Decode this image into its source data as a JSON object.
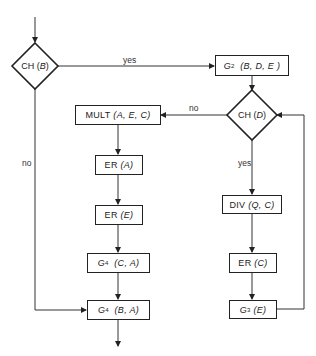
{
  "diagram": {
    "type": "flowchart",
    "decisions": [
      {
        "id": "ch_b",
        "label": "CH (B)"
      },
      {
        "id": "ch_d",
        "label": "CH (D)"
      }
    ],
    "processes": [
      {
        "id": "g2",
        "label": "G2 (B, D, E)"
      },
      {
        "id": "mult",
        "label": "MULT (A, E, C)"
      },
      {
        "id": "er_a",
        "label": "ER (A)"
      },
      {
        "id": "er_e",
        "label": "ER (E)"
      },
      {
        "id": "g4_ca",
        "label": "G4 (C, A)"
      },
      {
        "id": "g4_ba",
        "label": "G4 (B, A)"
      },
      {
        "id": "div",
        "label": "DIV (Q, C)"
      },
      {
        "id": "er_c",
        "label": "ER (C)"
      },
      {
        "id": "g3",
        "label": "G3 (E)"
      }
    ],
    "edge_labels": {
      "ch_b_yes": "yes",
      "ch_b_no": "no",
      "ch_d_no": "no",
      "ch_d_yes": "yes"
    },
    "edges": [
      {
        "from": "start",
        "to": "ch_b"
      },
      {
        "from": "ch_b",
        "to": "g2",
        "label": "yes"
      },
      {
        "from": "ch_b",
        "to": "g4_ba",
        "label": "no"
      },
      {
        "from": "g2",
        "to": "ch_d"
      },
      {
        "from": "ch_d",
        "to": "mult",
        "label": "no"
      },
      {
        "from": "ch_d",
        "to": "div",
        "label": "yes"
      },
      {
        "from": "mult",
        "to": "er_a"
      },
      {
        "from": "er_a",
        "to": "er_e"
      },
      {
        "from": "er_e",
        "to": "g4_ca"
      },
      {
        "from": "g4_ca",
        "to": "g4_ba"
      },
      {
        "from": "div",
        "to": "er_c"
      },
      {
        "from": "er_c",
        "to": "g3"
      },
      {
        "from": "g3",
        "to": "ch_d"
      },
      {
        "from": "g4_ba",
        "to": "end"
      }
    ]
  },
  "text": {
    "ch_b": {
      "fn": "CH",
      "arg": "B"
    },
    "ch_d": {
      "fn": "CH",
      "arg": "D"
    },
    "g2": {
      "fn": "G",
      "sub": "2",
      "args": "(B, D, E )"
    },
    "mult": {
      "fn": "MULT",
      "args": "(A, E, C)"
    },
    "er_a": {
      "fn": "ER",
      "args": "(A)"
    },
    "er_e": {
      "fn": "ER",
      "args": "(E)"
    },
    "g4_ca": {
      "fn": "G",
      "sub": "4",
      "args": "(C, A)"
    },
    "g4_ba": {
      "fn": "G",
      "sub": "4",
      "args": "(B, A)"
    },
    "div": {
      "fn": "DIV",
      "args": "(Q, C)"
    },
    "er_c": {
      "fn": "ER",
      "args": "(C)"
    },
    "g3": {
      "fn": "G",
      "sub": "3",
      "args": "(E)"
    },
    "yes_top": "yes",
    "no_left": "no",
    "no_mid": "no",
    "yes_right": "yes"
  }
}
